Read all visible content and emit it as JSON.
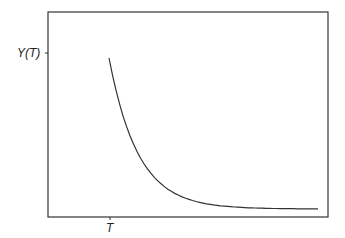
{
  "chart_data": {
    "type": "line",
    "title": "",
    "xlabel": "",
    "ylabel": "",
    "x_tick_labels": [
      "T"
    ],
    "y_tick_labels": [
      "Y(T)"
    ],
    "series": [
      {
        "name": "decay curve",
        "description": "Exponential decay starting at (T, Y(T)) and flattening to an asymptote near the bottom",
        "x": [
          0.0,
          0.1,
          0.2,
          0.3,
          0.4,
          0.5,
          0.6,
          0.7,
          0.8,
          0.9,
          1.0
        ],
        "y": [
          1.0,
          0.55,
          0.3,
          0.17,
          0.1,
          0.06,
          0.04,
          0.03,
          0.025,
          0.02,
          0.02
        ]
      }
    ],
    "grid": false,
    "legend": "none"
  },
  "labels": {
    "y_tick": "Y(T)",
    "x_tick": "T"
  },
  "colors": {
    "axis": "#333333",
    "curve": "#333333",
    "background": "#ffffff"
  }
}
